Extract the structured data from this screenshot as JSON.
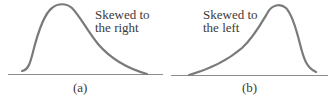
{
  "panels": [
    {
      "id": "a",
      "label_line1": "Skewed to",
      "label_line2": "the right",
      "caption": "(a)",
      "skew": "right"
    },
    {
      "id": "b",
      "label_line1": "Skewed to",
      "label_line2": "the left",
      "caption": "(b)",
      "skew": "left"
    }
  ],
  "colors": {
    "curve": "#7a7a7a",
    "baseline": "#8c8c8c",
    "text": "#3a3a3a"
  }
}
